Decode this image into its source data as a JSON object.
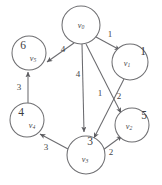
{
  "figure": {
    "background_color": "#ffffff",
    "stroke_color": "#6b6b6f",
    "text_color": "#46464a"
  },
  "graph_data": {
    "type": "directed-weighted-graph",
    "nodes": [
      {
        "id": "v0",
        "name": "v",
        "subscript": "0",
        "value": "",
        "cx": 81,
        "cy": 25,
        "r": 19
      },
      {
        "id": "v1",
        "name": "v",
        "subscript": "1",
        "value": "1",
        "cx": 130,
        "cy": 62,
        "r": 18
      },
      {
        "id": "v5",
        "name": "v",
        "subscript": "5",
        "value": "6",
        "cx": 29,
        "cy": 53,
        "r": 17
      },
      {
        "id": "v4",
        "name": "v",
        "subscript": "4",
        "value": "4",
        "cx": 27,
        "cy": 120,
        "r": 17
      },
      {
        "id": "v2",
        "name": "v",
        "subscript": "2",
        "value": "5",
        "cx": 132,
        "cy": 125,
        "r": 17
      },
      {
        "id": "v3",
        "name": "v",
        "subscript": "3",
        "value": "3",
        "cx": 86,
        "cy": 155,
        "r": 19
      }
    ],
    "edges": [
      {
        "id": "e-v0-v1",
        "from": "v0",
        "to": "v1",
        "weight": "1",
        "label_x": 110,
        "label_y": 35
      },
      {
        "id": "e-v0-v5",
        "from": "v0",
        "to": "v5",
        "weight": "4",
        "label_x": 63,
        "label_y": 50
      },
      {
        "id": "e-v0-v3",
        "from": "v0",
        "to": "v3",
        "weight": "4",
        "label_x": 78,
        "label_y": 75
      },
      {
        "id": "e-v0-v2",
        "from": "v0",
        "to": "v2",
        "weight": "1",
        "label_x": 100,
        "label_y": 94
      },
      {
        "id": "e-v1-v3",
        "from": "v1",
        "to": "v3",
        "weight": "2",
        "label_x": 119,
        "label_y": 97
      },
      {
        "id": "e-v4-v5",
        "from": "v4",
        "to": "v5",
        "weight": "3",
        "label_x": 19,
        "label_y": 88
      },
      {
        "id": "e-v3-v4",
        "from": "v3",
        "to": "v4",
        "weight": "3",
        "label_x": 46,
        "label_y": 148
      },
      {
        "id": "e-v3-v2",
        "from": "v3",
        "to": "v2",
        "weight": "2",
        "label_x": 111,
        "label_y": 153
      }
    ]
  }
}
